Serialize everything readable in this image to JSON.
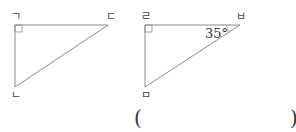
{
  "figures": [
    {
      "name": "triangle-1",
      "vertices": {
        "right_angle": "ㄱ",
        "top_right": "ㄷ",
        "bottom": "ㄴ"
      },
      "angle_label": ""
    },
    {
      "name": "triangle-2",
      "vertices": {
        "right_angle": "ㄹ",
        "top_right": "ㅂ",
        "bottom": "ㅁ"
      },
      "angle_label": "35°"
    }
  ],
  "answer": {
    "open": "(",
    "close": ")"
  },
  "colors": {
    "line": "#888888",
    "text": "#444444"
  }
}
